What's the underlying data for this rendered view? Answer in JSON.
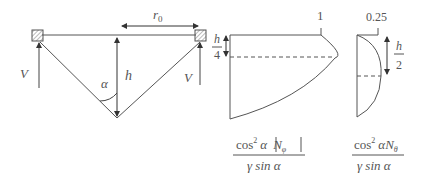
{
  "diagram": {
    "structure": {
      "left_reaction_label": "V",
      "right_reaction_label": "V",
      "height_label": "h",
      "radius_label": "r",
      "radius_subscript": "0",
      "angle_label": "α"
    },
    "plot_meridional": {
      "peak_value_label": "1",
      "offset_label_num": "h",
      "offset_label_den": "4",
      "formula_num_a": "cos",
      "formula_num_sup": "2",
      "formula_num_b": "α",
      "formula_num_c": "N",
      "formula_num_sub": "φ",
      "formula_den": "γ sin α"
    },
    "plot_hoop": {
      "peak_value_label": "0.25",
      "offset_label_num": "h",
      "offset_label_den": "2",
      "formula_num_a": "cos",
      "formula_num_sup": "2",
      "formula_num_b": "α",
      "formula_num_c": "N",
      "formula_num_sub": "θ",
      "formula_den": "γ sin α"
    }
  },
  "colors": {
    "line": "#555555",
    "hatch": "#777777"
  }
}
